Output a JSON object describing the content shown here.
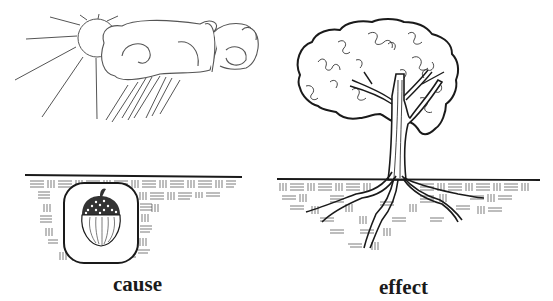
{
  "diagram": {
    "panels": [
      {
        "id": "cause",
        "label": "cause",
        "elements": [
          "sun-icon",
          "rain-cloud-icon",
          "rain-icon",
          "soil-ground",
          "acorn-icon"
        ]
      },
      {
        "id": "effect",
        "label": "effect",
        "elements": [
          "oak-tree-icon",
          "soil-ground",
          "roots"
        ]
      }
    ],
    "colors": {
      "background": "#ffffff",
      "ink": "#1a1a1a",
      "sketch": "#555555"
    }
  }
}
